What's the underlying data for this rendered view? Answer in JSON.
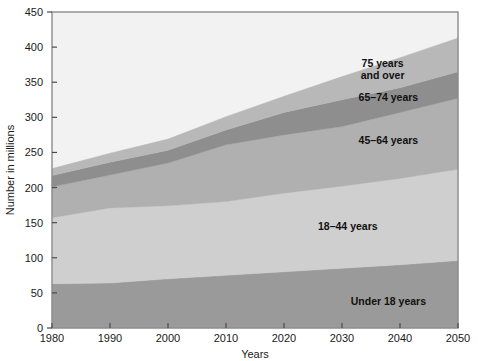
{
  "chart_data": {
    "type": "area",
    "stacked": true,
    "title": "",
    "xlabel": "Years",
    "ylabel": "Number in millions",
    "xlim": [
      1980,
      2050
    ],
    "ylim": [
      0,
      450
    ],
    "ytick_step": 50,
    "xtick_step": 10,
    "grid": false,
    "legend_position": "inline-annotations",
    "xticks": [
      1980,
      1990,
      2000,
      2010,
      2020,
      2030,
      2040,
      2050
    ],
    "yticks": [
      0,
      50,
      100,
      150,
      200,
      250,
      300,
      350,
      400,
      450
    ],
    "x": [
      1980,
      1990,
      2000,
      2010,
      2020,
      2030,
      2040,
      2050
    ],
    "series": [
      {
        "name": "Under 18 years",
        "color": "#9a9a9a",
        "values": [
          63,
          64,
          70,
          75,
          80,
          85,
          90,
          96
        ],
        "label_x": 2038,
        "label_y": 33
      },
      {
        "name": "18–44 years",
        "color": "#cfcfcf",
        "values": [
          94,
          107,
          104,
          105,
          112,
          117,
          123,
          130
        ],
        "label_x": 2031,
        "label_y": 140
      },
      {
        "name": "45–64 years",
        "color": "#b0b0b0",
        "values": [
          44,
          47,
          61,
          81,
          83,
          85,
          94,
          101
        ],
        "label_x": 2038,
        "label_y": 262
      },
      {
        "name": "65–74 years",
        "color": "#8e8e8e",
        "values": [
          16,
          18,
          18,
          21,
          32,
          38,
          35,
          38
        ],
        "label_x": 2038,
        "label_y": 323
      },
      {
        "name": "75 years\nand over",
        "color": "#b8b8b8",
        "values": [
          10,
          13,
          16,
          19,
          23,
          33,
          43,
          48
        ],
        "label_x": 2037,
        "label_y": 372,
        "label_lines": [
          "75 years",
          "and over"
        ]
      }
    ],
    "plot_background": "#f2f2f2",
    "frame_color": "#8c8c8c",
    "above_area_color": "#f2f2f2"
  },
  "axis": {
    "y_title": "Number in millions",
    "x_title": "Years"
  }
}
